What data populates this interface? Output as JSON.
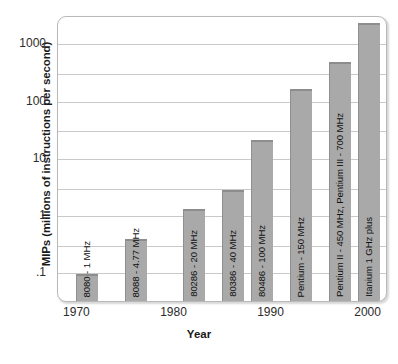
{
  "chart_data": {
    "type": "bar",
    "title": "",
    "xlabel": "Year",
    "ylabel": "MIPs (millions of instructions per second)",
    "yscale": "log",
    "ylim": [
      0.03,
      3000
    ],
    "xlim": [
      1968,
      2002
    ],
    "grid": true,
    "legend": false,
    "ytick_labels": [
      ".1",
      "1",
      "10",
      "100",
      "1000"
    ],
    "ytick_values": [
      0.1,
      1,
      10,
      100,
      1000
    ],
    "xtick_labels": [
      "1970",
      "1980",
      "1990",
      "2000"
    ],
    "xtick_values": [
      1970,
      1980,
      1990,
      2000
    ],
    "gridline_values": [
      0.1,
      0.3,
      1,
      3,
      10,
      30,
      100,
      300,
      1000
    ],
    "categories": [
      "8080 - 1 MHz",
      "8088 - 4.77 MHz",
      "80286 - 20 MHz",
      "80386 - 40 MHz",
      "80486 - 100 MHz",
      "Pentium - 150 MHz",
      "Pentium II - 450 MHz, Pentium III - 700 MHz",
      "Itanium 1 GHz plus"
    ],
    "values": [
      0.09,
      0.37,
      1.2,
      2.6,
      20,
      150,
      450,
      2200
    ],
    "bar_years": [
      1971,
      1976,
      1982,
      1986,
      1989,
      1993,
      1997,
      2000
    ],
    "bar_color": "#a9a9a9",
    "grid_color": "#c9c9c9",
    "axis_color": "#b9b9b9",
    "text_color": "#1a1a1a"
  }
}
